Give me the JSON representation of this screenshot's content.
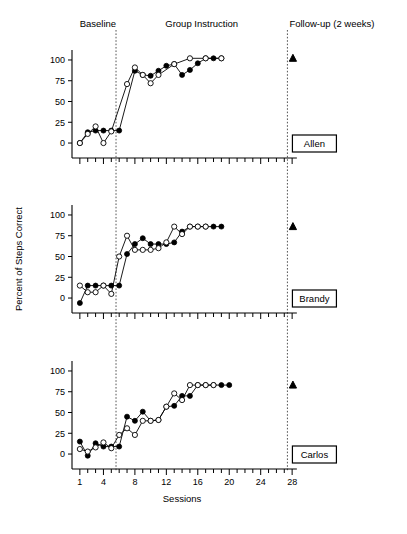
{
  "figure": {
    "title": "",
    "axis": {
      "xlabel": "Sessions",
      "ylabel": "Percent of Steps Correct",
      "xticklabels": [
        "1",
        "4",
        "8",
        "12",
        "16",
        "20",
        "24",
        "28"
      ],
      "xtickvalues": [
        1,
        4,
        8,
        12,
        16,
        20,
        24,
        28
      ],
      "yticklabels": [
        "0",
        "25",
        "50",
        "75",
        "100"
      ],
      "ytickvalues": [
        0,
        25,
        50,
        75,
        100
      ],
      "xlim": [
        0,
        29
      ],
      "ylim": [
        -18,
        112
      ],
      "grid": false
    },
    "phases": [
      {
        "name": "baseline",
        "label": "Baseline",
        "start": 1,
        "end": 5.6
      },
      {
        "name": "group-instruction",
        "label": "Group Instruction",
        "start": 5.6,
        "end": 27.4
      },
      {
        "name": "follow-up",
        "label": "Follow-up (2 weeks)",
        "start": 27.4,
        "end": 29
      }
    ],
    "phase_line_x": [
      5.6,
      27.4
    ],
    "legend_note": "",
    "colors": {
      "ink": "#000000",
      "phase_divider": "#555555",
      "background": "#ffffff"
    }
  },
  "chart_data": [
    {
      "type": "line",
      "panel": "Allen",
      "title": "Allen",
      "xlabel": "Sessions",
      "ylabel": "Percent of Steps Correct",
      "xlim": [
        0,
        29
      ],
      "ylim": [
        -18,
        112
      ],
      "grid": false,
      "series": [
        {
          "name": "filled-circle",
          "marker": "filled-circle",
          "x": [
            1,
            2,
            3,
            4,
            5,
            6,
            7,
            8,
            9,
            10,
            11,
            12,
            13,
            14,
            15,
            16,
            17,
            18,
            19,
            20,
            21,
            22,
            23
          ],
          "y": [
            0,
            13,
            15,
            15,
            15,
            15,
            null,
            87,
            82,
            81,
            87,
            93,
            95,
            82,
            88,
            96,
            102,
            102,
            102,
            null,
            null,
            null,
            null
          ]
        },
        {
          "name": "open-circle",
          "marker": "open-circle",
          "x": [
            1,
            2,
            3,
            4,
            5,
            7,
            8,
            9,
            10,
            11,
            13,
            15,
            17,
            19,
            21
          ],
          "y": [
            0,
            11,
            20,
            0,
            14,
            71,
            91,
            82,
            72,
            82,
            95,
            102,
            102,
            102,
            null
          ]
        }
      ],
      "followup": {
        "marker": "filled-triangle",
        "x": 28.1,
        "y": 102
      }
    },
    {
      "type": "line",
      "panel": "Brandy",
      "title": "Brandy",
      "xlabel": "Sessions",
      "ylabel": "Percent of Steps Correct",
      "xlim": [
        0,
        29
      ],
      "ylim": [
        -18,
        112
      ],
      "grid": false,
      "series": [
        {
          "name": "filled-circle",
          "marker": "filled-circle",
          "x": [
            1,
            2,
            3,
            4,
            5,
            6,
            7,
            8,
            9,
            10,
            11,
            12,
            13,
            14,
            15,
            16,
            17,
            18,
            19,
            20,
            21,
            22,
            23
          ],
          "y": [
            -6,
            15,
            15,
            15,
            15,
            15,
            53,
            65,
            72,
            65,
            65,
            65,
            67,
            80,
            86,
            86,
            86,
            86,
            86,
            null,
            null,
            null,
            null
          ]
        },
        {
          "name": "open-circle",
          "marker": "open-circle",
          "x": [
            1,
            2,
            3,
            4,
            5,
            6,
            7,
            8,
            9,
            10,
            11,
            12,
            13,
            14,
            15,
            16,
            17,
            18,
            19,
            20
          ],
          "y": [
            15,
            7,
            7,
            15,
            5,
            50,
            75,
            58,
            58,
            58,
            60,
            67,
            86,
            77,
            86,
            86,
            86,
            null,
            null,
            null
          ]
        }
      ],
      "followup": {
        "marker": "filled-triangle",
        "x": 28.1,
        "y": 86
      }
    },
    {
      "type": "line",
      "panel": "Carlos",
      "title": "Carlos",
      "xlabel": "Sessions",
      "ylabel": "Percent of Steps Correct",
      "xlim": [
        0,
        29
      ],
      "ylim": [
        -18,
        112
      ],
      "grid": false,
      "series": [
        {
          "name": "filled-circle",
          "marker": "filled-circle",
          "x": [
            1,
            2,
            3,
            4,
            5,
            6,
            7,
            8,
            9,
            10,
            11,
            12,
            13,
            14,
            15,
            16,
            17,
            18,
            19,
            20,
            21,
            22,
            23,
            24
          ],
          "y": [
            15,
            -2,
            13,
            9,
            9,
            9,
            45,
            40,
            51,
            40,
            41,
            57,
            58,
            70,
            70,
            83,
            83,
            83,
            83,
            83,
            null,
            null,
            null,
            null
          ]
        },
        {
          "name": "open-circle",
          "marker": "open-circle",
          "x": [
            1,
            2,
            3,
            4,
            5,
            6,
            7,
            8,
            9,
            10,
            11,
            12,
            13,
            14,
            15,
            16,
            17,
            18,
            19,
            20,
            21
          ],
          "y": [
            6,
            3,
            8,
            14,
            7,
            23,
            31,
            23,
            40,
            40,
            41,
            57,
            73,
            65,
            83,
            83,
            83,
            83,
            null,
            null,
            null
          ]
        }
      ],
      "followup": {
        "marker": "filled-triangle",
        "x": 28.1,
        "y": 83
      }
    }
  ],
  "panels": [
    {
      "name": "allen",
      "label": "Allen"
    },
    {
      "name": "brandy",
      "label": "Brandy"
    },
    {
      "name": "carlos",
      "label": "Carlos"
    }
  ]
}
